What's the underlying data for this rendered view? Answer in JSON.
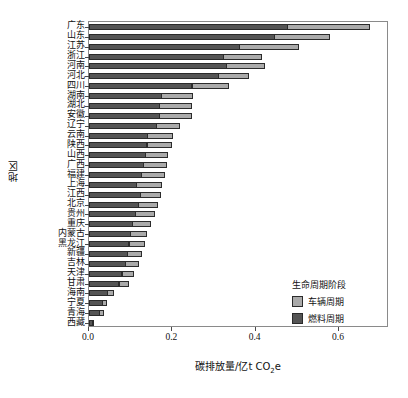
{
  "chart_data": {
    "type": "bar",
    "orientation": "horizontal",
    "stacked": true,
    "title": "",
    "xlabel": "碳排放量/亿t CO₂e",
    "ylabel": "地区",
    "xlim": [
      0.0,
      0.72
    ],
    "xticks": [
      0.0,
      0.2,
      0.4,
      0.6
    ],
    "xtick_labels": [
      "0.0",
      "0.2",
      "0.4",
      "0.6"
    ],
    "grid": false,
    "legend": {
      "title": "生命周期阶段",
      "position": "lower-right",
      "entries": [
        {
          "label": "车辆周期",
          "color": "#aaaaaa"
        },
        {
          "label": "燃料周期",
          "color": "#555555"
        }
      ]
    },
    "categories": [
      "广东",
      "山东",
      "江苏",
      "浙江",
      "河南",
      "河北",
      "四川",
      "湖南",
      "湖北",
      "安徽",
      "辽宁",
      "云南",
      "陕西",
      "山西",
      "广西",
      "福建",
      "上海",
      "江西",
      "北京",
      "贵州",
      "重庆",
      "内蒙古",
      "黑龙江",
      "新疆",
      "吉林",
      "天津",
      "甘肃",
      "海南",
      "宁夏",
      "青海",
      "西藏"
    ],
    "series": [
      {
        "name": "燃料周期",
        "color": "#555555",
        "values": [
          0.478,
          0.446,
          0.363,
          0.323,
          0.331,
          0.311,
          0.248,
          0.174,
          0.171,
          0.171,
          0.163,
          0.142,
          0.14,
          0.136,
          0.131,
          0.127,
          0.114,
          0.125,
          0.119,
          0.113,
          0.105,
          0.1,
          0.097,
          0.093,
          0.088,
          0.08,
          0.073,
          0.046,
          0.034,
          0.027,
          0.009
        ]
      },
      {
        "name": "车辆周期",
        "color": "#aaaaaa",
        "values": [
          0.199,
          0.134,
          0.142,
          0.093,
          0.094,
          0.074,
          0.09,
          0.077,
          0.078,
          0.078,
          0.057,
          0.062,
          0.06,
          0.056,
          0.057,
          0.058,
          0.064,
          0.05,
          0.049,
          0.047,
          0.045,
          0.041,
          0.039,
          0.035,
          0.033,
          0.029,
          0.026,
          0.017,
          0.012,
          0.01,
          0.005
        ]
      }
    ],
    "totals": [
      0.677,
      0.58,
      0.505,
      0.416,
      0.425,
      0.385,
      0.338,
      0.251,
      0.249,
      0.249,
      0.22,
      0.204,
      0.2,
      0.192,
      0.188,
      0.185,
      0.178,
      0.175,
      0.168,
      0.16,
      0.15,
      0.141,
      0.136,
      0.128,
      0.121,
      0.109,
      0.099,
      0.063,
      0.046,
      0.037,
      0.014
    ]
  },
  "axes": {
    "x_title": "碳排放量/亿t CO",
    "x_title_sub": "2",
    "x_title_tail": "e",
    "y_title": "地区"
  }
}
